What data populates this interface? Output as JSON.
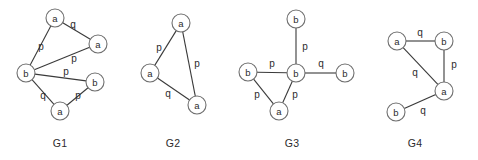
{
  "figure": {
    "title": "",
    "width": 478,
    "height": 160,
    "background": "#ffffff",
    "node_stroke": "#6f6f6f",
    "edge_stroke": "#3a3a3a",
    "text_color": "#2b2b2b",
    "node_radius": 9
  },
  "graphs": [
    {
      "id": "G1",
      "caption": "G1",
      "caption_pos": {
        "x": 60,
        "y": 143
      },
      "nodes": [
        {
          "id": "g1n1",
          "label": "a",
          "x": 55,
          "y": 18
        },
        {
          "id": "g1n2",
          "label": "a",
          "x": 98,
          "y": 44
        },
        {
          "id": "g1n3",
          "label": "b",
          "x": 26,
          "y": 73
        },
        {
          "id": "g1n4",
          "label": "b",
          "x": 95,
          "y": 82
        },
        {
          "id": "g1n5",
          "label": "a",
          "x": 60,
          "y": 111
        }
      ],
      "edges": [
        {
          "from": "g1n1",
          "to": "g1n2",
          "label": "q",
          "label_pos": {
            "x": 73,
            "y": 24
          }
        },
        {
          "from": "g1n3",
          "to": "g1n1",
          "label": "p",
          "label_pos": {
            "x": 41,
            "y": 46
          }
        },
        {
          "from": "g1n3",
          "to": "g1n2",
          "label": "p",
          "label_pos": {
            "x": 74,
            "y": 58
          }
        },
        {
          "from": "g1n3",
          "to": "g1n4",
          "label": "p",
          "label_pos": {
            "x": 66,
            "y": 71
          }
        },
        {
          "from": "g1n3",
          "to": "g1n5",
          "label": "q",
          "label_pos": {
            "x": 43,
            "y": 95
          }
        },
        {
          "from": "g1n5",
          "to": "g1n4",
          "label": "p",
          "label_pos": {
            "x": 78,
            "y": 95
          }
        }
      ]
    },
    {
      "id": "G2",
      "caption": "G2",
      "caption_pos": {
        "x": 173,
        "y": 143
      },
      "nodes": [
        {
          "id": "g2n1",
          "label": "a",
          "x": 181,
          "y": 23
        },
        {
          "id": "g2n2",
          "label": "a",
          "x": 150,
          "y": 73
        },
        {
          "id": "g2n3",
          "label": "a",
          "x": 197,
          "y": 105
        }
      ],
      "edges": [
        {
          "from": "g2n2",
          "to": "g2n1",
          "label": "p",
          "label_pos": {
            "x": 159,
            "y": 47
          }
        },
        {
          "from": "g2n1",
          "to": "g2n3",
          "label": "p",
          "label_pos": {
            "x": 197,
            "y": 63
          }
        },
        {
          "from": "g2n2",
          "to": "g2n3",
          "label": "q",
          "label_pos": {
            "x": 168,
            "y": 93
          }
        }
      ]
    },
    {
      "id": "G3",
      "caption": "G3",
      "caption_pos": {
        "x": 292,
        "y": 143
      },
      "nodes": [
        {
          "id": "g3n1",
          "label": "b",
          "x": 296,
          "y": 19
        },
        {
          "id": "g3n2",
          "label": "b",
          "x": 248,
          "y": 72
        },
        {
          "id": "g3n3",
          "label": "b",
          "x": 296,
          "y": 73
        },
        {
          "id": "g3n4",
          "label": "b",
          "x": 345,
          "y": 73
        },
        {
          "id": "g3n5",
          "label": "a",
          "x": 279,
          "y": 111
        }
      ],
      "edges": [
        {
          "from": "g3n1",
          "to": "g3n3",
          "label": "p",
          "label_pos": {
            "x": 305,
            "y": 46
          }
        },
        {
          "from": "g3n2",
          "to": "g3n3",
          "label": "p",
          "label_pos": {
            "x": 272,
            "y": 63
          }
        },
        {
          "from": "g3n3",
          "to": "g3n4",
          "label": "q",
          "label_pos": {
            "x": 321,
            "y": 63
          }
        },
        {
          "from": "g3n2",
          "to": "g3n5",
          "label": "p",
          "label_pos": {
            "x": 257,
            "y": 94
          }
        },
        {
          "from": "g3n3",
          "to": "g3n5",
          "label": "p",
          "label_pos": {
            "x": 295,
            "y": 94
          }
        }
      ]
    },
    {
      "id": "G4",
      "caption": "G4",
      "caption_pos": {
        "x": 415,
        "y": 143
      },
      "nodes": [
        {
          "id": "g4n1",
          "label": "a",
          "x": 397,
          "y": 41
        },
        {
          "id": "g4n2",
          "label": "b",
          "x": 444,
          "y": 41
        },
        {
          "id": "g4n3",
          "label": "a",
          "x": 444,
          "y": 91
        },
        {
          "id": "g4n4",
          "label": "b",
          "x": 396,
          "y": 112
        }
      ],
      "edges": [
        {
          "from": "g4n1",
          "to": "g4n2",
          "label": "q",
          "label_pos": {
            "x": 420,
            "y": 32
          }
        },
        {
          "from": "g4n2",
          "to": "g4n3",
          "label": "p",
          "label_pos": {
            "x": 454,
            "y": 64
          }
        },
        {
          "from": "g4n1",
          "to": "g4n3",
          "label": "q",
          "label_pos": {
            "x": 415,
            "y": 72
          }
        },
        {
          "from": "g4n4",
          "to": "g4n3",
          "label": "q",
          "label_pos": {
            "x": 423,
            "y": 110
          }
        }
      ]
    }
  ]
}
